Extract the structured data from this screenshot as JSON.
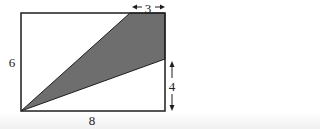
{
  "diagram": {
    "rectangle": {
      "width_label": "8",
      "height_label": "6"
    },
    "dimensions": {
      "top_segment_label": "3",
      "right_segment_label": "4",
      "bottom_label": "8",
      "left_label": "6"
    },
    "colors": {
      "shade": "#6e6e6e",
      "stroke": "#1e1e1e",
      "background": "#ffffff"
    }
  }
}
